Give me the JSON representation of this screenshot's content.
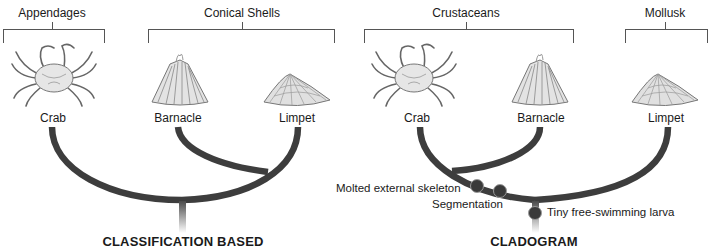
{
  "left_panel": {
    "title": "CLASSIFICATION BASED",
    "groups": [
      {
        "label": "Appendages",
        "members": [
          "Crab"
        ]
      },
      {
        "label": "Conical Shells",
        "members": [
          "Barnacle",
          "Limpet"
        ]
      }
    ],
    "taxa": [
      "Crab",
      "Barnacle",
      "Limpet"
    ]
  },
  "right_panel": {
    "title": "CLADOGRAM",
    "groups": [
      {
        "label": "Crustaceans",
        "members": [
          "Crab",
          "Barnacle"
        ]
      },
      {
        "label": "Mollusk",
        "members": [
          "Limpet"
        ]
      }
    ],
    "taxa": [
      "Crab",
      "Barnacle",
      "Limpet"
    ],
    "traits": [
      {
        "label": "Molted external skeleton"
      },
      {
        "label": "Segmentation"
      },
      {
        "label": "Tiny free-swimming larva"
      }
    ]
  },
  "colors": {
    "branch": "#3d3d3d",
    "node": "#3a3a3a",
    "bracket": "#555555",
    "text": "#1a1a1a"
  },
  "icons": {
    "crab": "crab-illustration",
    "barnacle": "barnacle-illustration",
    "limpet": "limpet-illustration"
  }
}
